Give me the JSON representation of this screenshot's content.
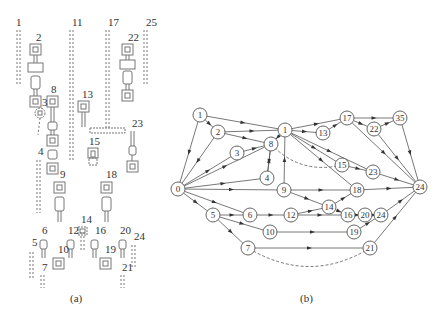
{
  "panel_a": {
    "caption": "(a)",
    "labels": [
      {
        "id": "1",
        "x": 16,
        "y": 26
      },
      {
        "id": "2",
        "x": 36,
        "y": 41
      },
      {
        "id": "11",
        "x": 72,
        "y": 26
      },
      {
        "id": "17",
        "x": 108,
        "y": 26
      },
      {
        "id": "25",
        "x": 146,
        "y": 26
      },
      {
        "id": "22",
        "x": 128,
        "y": 41
      },
      {
        "id": "8",
        "x": 51,
        "y": 93
      },
      {
        "id": "3",
        "x": 42,
        "y": 106
      },
      {
        "id": "13",
        "x": 82,
        "y": 98
      },
      {
        "id": "23",
        "x": 132,
        "y": 127
      },
      {
        "id": "15",
        "x": 89,
        "y": 145
      },
      {
        "id": "4",
        "x": 38,
        "y": 155
      },
      {
        "id": "9",
        "x": 60,
        "y": 178
      },
      {
        "id": "18",
        "x": 106,
        "y": 178
      },
      {
        "id": "14",
        "x": 81,
        "y": 223
      },
      {
        "id": "6",
        "x": 42,
        "y": 234
      },
      {
        "id": "12",
        "x": 68,
        "y": 234
      },
      {
        "id": "16",
        "x": 95,
        "y": 234
      },
      {
        "id": "20",
        "x": 120,
        "y": 234
      },
      {
        "id": "24",
        "x": 134,
        "y": 240
      },
      {
        "id": "5",
        "x": 32,
        "y": 246
      },
      {
        "id": "10",
        "x": 58,
        "y": 253
      },
      {
        "id": "19",
        "x": 105,
        "y": 253
      },
      {
        "id": "7",
        "x": 42,
        "y": 271
      },
      {
        "id": "21",
        "x": 122,
        "y": 271
      }
    ]
  },
  "panel_b": {
    "caption": "(b)",
    "nodes": [
      {
        "id": "0",
        "label": "0",
        "x": 178,
        "y": 189
      },
      {
        "id": "1a",
        "label": "1",
        "x": 200,
        "y": 115
      },
      {
        "id": "2",
        "label": "2",
        "x": 218,
        "y": 132
      },
      {
        "id": "3",
        "label": "3",
        "x": 237,
        "y": 153
      },
      {
        "id": "8",
        "label": "8",
        "x": 271,
        "y": 144
      },
      {
        "id": "1b",
        "label": "1",
        "x": 285,
        "y": 130
      },
      {
        "id": "4",
        "label": "4",
        "x": 267,
        "y": 178
      },
      {
        "id": "9",
        "label": "9",
        "x": 284,
        "y": 190
      },
      {
        "id": "13",
        "label": "13",
        "x": 323,
        "y": 133
      },
      {
        "id": "17",
        "label": "17",
        "x": 347,
        "y": 118
      },
      {
        "id": "22",
        "label": "22",
        "x": 374,
        "y": 129
      },
      {
        "id": "35",
        "label": "35",
        "x": 400,
        "y": 118
      },
      {
        "id": "15",
        "label": "15",
        "x": 342,
        "y": 165
      },
      {
        "id": "23",
        "label": "23",
        "x": 373,
        "y": 172
      },
      {
        "id": "18",
        "label": "18",
        "x": 357,
        "y": 190
      },
      {
        "id": "24",
        "label": "24",
        "x": 420,
        "y": 187
      },
      {
        "id": "14",
        "label": "14",
        "x": 329,
        "y": 207
      },
      {
        "id": "5",
        "label": "5",
        "x": 213,
        "y": 215
      },
      {
        "id": "6",
        "label": "6",
        "x": 250,
        "y": 215
      },
      {
        "id": "12",
        "label": "12",
        "x": 291,
        "y": 215
      },
      {
        "id": "16",
        "label": "16",
        "x": 348,
        "y": 215
      },
      {
        "id": "20",
        "label": "20",
        "x": 365,
        "y": 215
      },
      {
        "id": "24b",
        "label": "24",
        "x": 381,
        "y": 215
      },
      {
        "id": "10",
        "label": "10",
        "x": 270,
        "y": 232
      },
      {
        "id": "19",
        "label": "19",
        "x": 354,
        "y": 232
      },
      {
        "id": "7",
        "label": "7",
        "x": 248,
        "y": 248
      },
      {
        "id": "21",
        "label": "21",
        "x": 370,
        "y": 248
      }
    ],
    "edges": [
      [
        "1a",
        "1b"
      ],
      [
        "1a",
        "2"
      ],
      [
        "1a",
        "0"
      ],
      [
        "2",
        "1b"
      ],
      [
        "2",
        "8"
      ],
      [
        "2",
        "0"
      ],
      [
        "0",
        "3"
      ],
      [
        "3",
        "8"
      ],
      [
        "0",
        "8"
      ],
      [
        "0",
        "4"
      ],
      [
        "0",
        "9"
      ],
      [
        "0",
        "5"
      ],
      [
        "0",
        "6"
      ],
      [
        "4",
        "8"
      ],
      [
        "8",
        "4"
      ],
      [
        "9",
        "1b"
      ],
      [
        "1b",
        "8"
      ],
      [
        "1b",
        "13"
      ],
      [
        "13",
        "17"
      ],
      [
        "1b",
        "17"
      ],
      [
        "17",
        "35"
      ],
      [
        "17",
        "22"
      ],
      [
        "22",
        "35"
      ],
      [
        "17",
        "24"
      ],
      [
        "22",
        "24"
      ],
      [
        "35",
        "24"
      ],
      [
        "1b",
        "15"
      ],
      [
        "1b",
        "23"
      ],
      [
        "15",
        "23"
      ],
      [
        "23",
        "24"
      ],
      [
        "1b",
        "18"
      ],
      [
        "18",
        "24"
      ],
      [
        "9",
        "18"
      ],
      [
        "9",
        "14"
      ],
      [
        "14",
        "18"
      ],
      [
        "14",
        "16"
      ],
      [
        "12",
        "14"
      ],
      [
        "12",
        "16"
      ],
      [
        "5",
        "6"
      ],
      [
        "6",
        "12"
      ],
      [
        "5",
        "10"
      ],
      [
        "5",
        "7"
      ],
      [
        "10",
        "19"
      ],
      [
        "19",
        "24b"
      ],
      [
        "16",
        "20"
      ],
      [
        "20",
        "24b"
      ],
      [
        "24b",
        "24"
      ],
      [
        "7",
        "21"
      ],
      [
        "21",
        "24"
      ]
    ],
    "dashed_edges": [
      {
        "from": "8",
        "to": "15",
        "desc": "dashed curve from 8 to 15"
      },
      {
        "from": "21",
        "to": "7",
        "desc": "dashed curve from 21 back to 7"
      }
    ]
  }
}
